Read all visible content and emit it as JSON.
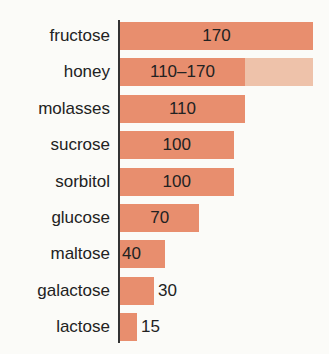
{
  "chart_data": {
    "type": "bar",
    "orientation": "horizontal",
    "title": "",
    "xlabel": "",
    "ylabel": "",
    "categories": [
      "fructose",
      "honey",
      "molasses",
      "sucrose",
      "sorbitol",
      "glucose",
      "maltose",
      "galactose",
      "lactose"
    ],
    "values": [
      170,
      110,
      110,
      100,
      100,
      70,
      40,
      30,
      15
    ],
    "range_max": [
      null,
      170,
      null,
      null,
      null,
      null,
      null,
      null,
      null
    ],
    "value_labels": [
      "170",
      "110–170",
      "110",
      "100",
      "100",
      "70",
      "40",
      "30",
      "15"
    ],
    "xlim": [
      0,
      170
    ],
    "grid": false,
    "legend": null,
    "colors": {
      "bar": "#e88e6e",
      "range": "#eec2aa",
      "axis": "#333333"
    }
  }
}
